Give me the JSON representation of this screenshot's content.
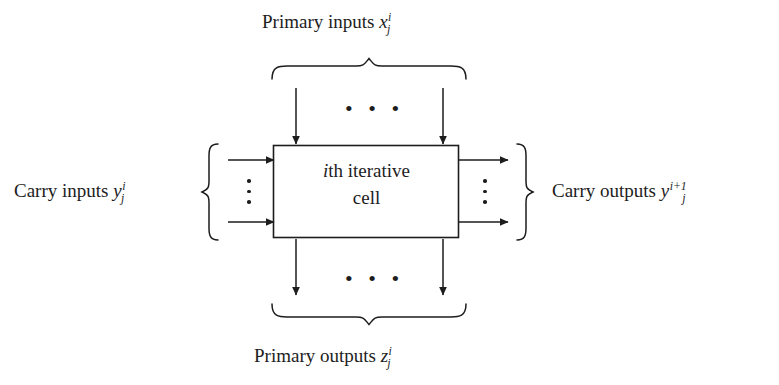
{
  "figure": {
    "type": "block-diagram",
    "background_color": "#ffffff",
    "line_color": "#1d1d1d"
  },
  "cell": {
    "line1_prefix": "i",
    "line1_rest": "th iterative",
    "line2": "cell",
    "box": {
      "x": 273,
      "y": 145,
      "width": 186,
      "height": 93
    }
  },
  "labels": {
    "primary_inputs": {
      "text": "Primary inputs ",
      "symbol": "x",
      "superscript": "i",
      "subscript": "j"
    },
    "primary_outputs": {
      "text": "Primary outputs ",
      "symbol": "z",
      "superscript": "i",
      "subscript": "j"
    },
    "carry_inputs": {
      "text": "Carry inputs ",
      "symbol": "y",
      "superscript": "i",
      "subscript": "j"
    },
    "carry_outputs": {
      "text": "Carry outputs ",
      "symbol": "y",
      "superscript": "i+1",
      "subscript": "j"
    }
  },
  "ellipses": {
    "horizontal": "• • •",
    "vertical_dot_count": 3
  },
  "arrows": {
    "top": [
      {
        "name": "primary-input-arrow-left",
        "x": 296,
        "y1": 88,
        "y2": 144
      },
      {
        "name": "primary-input-arrow-right",
        "x": 443,
        "y1": 88,
        "y2": 144
      }
    ],
    "bottom": [
      {
        "name": "primary-output-arrow-left",
        "x": 296,
        "y1": 239,
        "y2": 295
      },
      {
        "name": "primary-output-arrow-right",
        "x": 443,
        "y1": 239,
        "y2": 295
      }
    ],
    "left": [
      {
        "name": "carry-input-arrow-top",
        "y": 160,
        "x1": 228,
        "x2": 272
      },
      {
        "name": "carry-input-arrow-bottom",
        "y": 222,
        "x1": 228,
        "x2": 272
      }
    ],
    "right": [
      {
        "name": "carry-output-arrow-top",
        "y": 160,
        "x1": 460,
        "x2": 507
      },
      {
        "name": "carry-output-arrow-bottom",
        "y": 222,
        "x1": 460,
        "x2": 507
      }
    ]
  },
  "braces": {
    "top": {
      "x1": 272,
      "x2": 466,
      "y": 78,
      "apex_x": 369,
      "direction": "down-apex"
    },
    "bottom": {
      "x1": 272,
      "x2": 466,
      "y": 305,
      "apex_x": 369,
      "direction": "up-apex"
    },
    "left": {
      "y1": 145,
      "y2": 240,
      "x": 218,
      "apex_y": 192,
      "direction": "right-apex"
    },
    "right": {
      "y1": 145,
      "y2": 240,
      "x": 517,
      "apex_y": 192,
      "direction": "left-apex"
    }
  }
}
